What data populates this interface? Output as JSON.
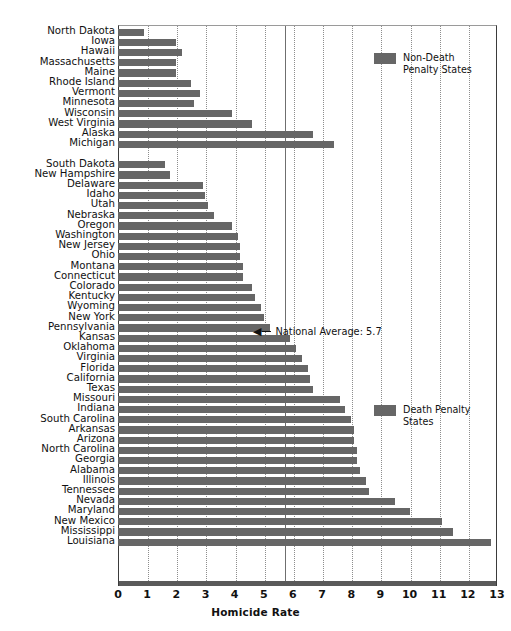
{
  "chart_data": {
    "type": "bar",
    "orientation": "horizontal",
    "title": "",
    "xlabel": "Homicide Rate",
    "ylabel": "",
    "xlim": [
      0,
      13
    ],
    "xticks": [
      0,
      1,
      2,
      3,
      4,
      5,
      6,
      7,
      8,
      9,
      10,
      11,
      12,
      13
    ],
    "grid": true,
    "legend_position": "inside-right",
    "series": [
      {
        "name": "Non-Death Penalty States",
        "color": "#666666",
        "categories": [
          "North Dakota",
          "Iowa",
          "Hawaii",
          "Massachusetts",
          "Maine",
          "Rhode Island",
          "Vermont",
          "Minnesota",
          "Wisconsin",
          "West Virginia",
          "Alaska",
          "Michigan"
        ],
        "values": [
          0.9,
          2.0,
          2.2,
          2.0,
          2.0,
          2.5,
          2.8,
          2.6,
          3.9,
          4.6,
          6.7,
          7.4
        ]
      },
      {
        "name": "Death Penalty States",
        "color": "#666666",
        "categories": [
          "South Dakota",
          "New Hampshire",
          "Delaware",
          "Idaho",
          "Utah",
          "Nebraska",
          "Oregon",
          "Washington",
          "New Jersey",
          "Ohio",
          "Montana",
          "Connecticut",
          "Colorado",
          "Kentucky",
          "Wyoming",
          "New York",
          "Pennsylvania",
          "Kansas",
          "Oklahoma",
          "Virginia",
          "Florida",
          "California",
          "Texas",
          "Missouri",
          "Indiana",
          "South Carolina",
          "Arkansas",
          "Arizona",
          "North Carolina",
          "Georgia",
          "Alabama",
          "Illinois",
          "Tennessee",
          "Nevada",
          "Maryland",
          "New Mexico",
          "Mississippi",
          "Louisiana"
        ],
        "values": [
          1.6,
          1.8,
          2.9,
          3.0,
          3.1,
          3.3,
          3.9,
          4.1,
          4.2,
          4.2,
          4.3,
          4.3,
          4.6,
          4.7,
          4.9,
          5.0,
          5.2,
          5.9,
          6.1,
          6.3,
          6.5,
          6.6,
          6.7,
          7.6,
          7.8,
          8.0,
          8.1,
          8.1,
          8.2,
          8.2,
          8.3,
          8.5,
          8.6,
          9.5,
          10.0,
          11.1,
          11.5,
          12.8
        ]
      }
    ],
    "annotations": [
      {
        "text": "National Average: 5.7",
        "value": 5.7,
        "arrow": "left",
        "at_category": "New York"
      }
    ]
  },
  "legend": {
    "non_death": "Non-Death\nPenalty States",
    "death": "Death Penalty\nStates"
  },
  "axis": {
    "x_label": "Homicide Rate",
    "tick_labels": [
      "0",
      "1",
      "2",
      "3",
      "4",
      "5",
      "6",
      "7",
      "8",
      "9",
      "10",
      "11",
      "12",
      "13"
    ]
  },
  "annotation": {
    "text": "National Average: 5.7",
    "arrow_glyph": "◀"
  }
}
